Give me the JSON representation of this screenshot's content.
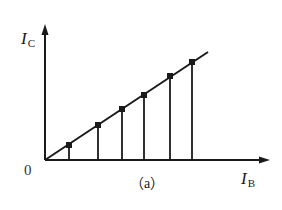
{
  "figure": {
    "caption": "（a）",
    "origin_label": "0",
    "y_axis": {
      "symbol": "I",
      "subscript": "C"
    },
    "x_axis": {
      "symbol": "I",
      "subscript": "B"
    },
    "colors": {
      "ink": "#1a1a1a",
      "background": "#ffffff"
    }
  },
  "geometry": {
    "origin": [
      45,
      160
    ],
    "y_axis_top": [
      45,
      24
    ],
    "x_axis_right": [
      270,
      160
    ],
    "line_end": [
      208,
      52
    ],
    "markers": [
      [
        69,
        145
      ],
      [
        98,
        125
      ],
      [
        122,
        109
      ],
      [
        144,
        95
      ],
      [
        170,
        76
      ],
      [
        192,
        62
      ]
    ],
    "marker_size": 6
  }
}
